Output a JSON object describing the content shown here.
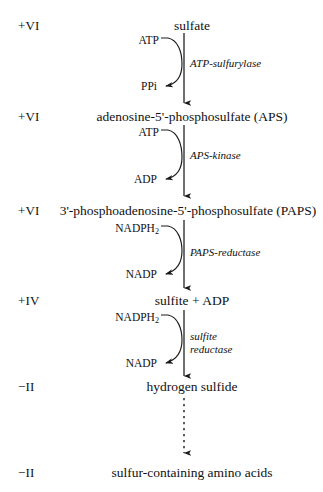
{
  "diagram": {
    "axis_x": 184,
    "colors": {
      "background": "#ffffff",
      "ink": "#111111",
      "stroke": "#1a1a1a"
    },
    "oxidation_states": [
      {
        "label": "+VI",
        "y": 26
      },
      {
        "label": "+VI",
        "y": 117
      },
      {
        "label": "+VI",
        "y": 211
      },
      {
        "label": "+IV",
        "y": 301
      },
      {
        "label": "−II",
        "y": 387
      },
      {
        "label": "−II",
        "y": 473
      }
    ],
    "compounds": [
      {
        "name": "sulfate",
        "x": 192,
        "y": 26
      },
      {
        "name": "adenosine-5'-phosphosulfate (APS)",
        "x": 192,
        "y": 117
      },
      {
        "name": "3'-phosphoadenosine-5'-phosphosulfate (PAPS)",
        "x": 188,
        "y": 211
      },
      {
        "name": "sulfite + ADP",
        "x": 192,
        "y": 301
      },
      {
        "name": "hydrogen sulfide",
        "x": 192,
        "y": 387
      },
      {
        "name": "sulfur-containing amino acids",
        "x": 192,
        "y": 473
      }
    ],
    "steps": [
      {
        "enzyme": "ATP-sulfurylase",
        "enzyme_x": 190,
        "enzyme_y": 63,
        "substrate_cofactor": "ATP",
        "substrate_x": 159,
        "substrate_y": 41,
        "product_cofactor": "PPi",
        "product_x": 157,
        "product_y": 87,
        "arrow_top": 33,
        "arrow_bottom": 105
      },
      {
        "enzyme": "APS-kinase",
        "enzyme_x": 190,
        "enzyme_y": 155,
        "substrate_cofactor": "ATP",
        "substrate_x": 159,
        "substrate_y": 133,
        "product_cofactor": "ADP",
        "product_x": 157,
        "product_y": 180,
        "arrow_top": 125,
        "arrow_bottom": 198
      },
      {
        "enzyme": "PAPS-reductase",
        "enzyme_x": 190,
        "enzyme_y": 252,
        "substrate_cofactor": "NADPH2",
        "substrate_x": 159,
        "substrate_y": 229,
        "product_cofactor": "NADP",
        "product_x": 157,
        "product_y": 275,
        "arrow_top": 220,
        "arrow_bottom": 290
      },
      {
        "enzyme": "sulfite\nreductase",
        "enzyme_x": 190,
        "enzyme_y": 336,
        "substrate_cofactor": "NADPH2",
        "substrate_x": 159,
        "substrate_y": 318,
        "product_cofactor": "NADP",
        "product_x": 157,
        "product_y": 364,
        "arrow_top": 310,
        "arrow_bottom": 378
      }
    ],
    "final_arrow": {
      "style": "dashed",
      "x": 184,
      "top": 398,
      "bottom": 455
    }
  }
}
